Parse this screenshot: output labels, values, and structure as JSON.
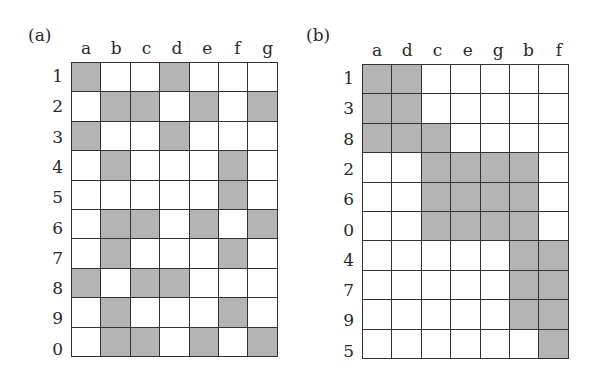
{
  "panels": [
    {
      "label": "(a)",
      "columns": [
        "a",
        "b",
        "c",
        "d",
        "e",
        "f",
        "g"
      ],
      "rows": [
        {
          "label": "1",
          "filled": [
            "a",
            "d"
          ]
        },
        {
          "label": "2",
          "filled": [
            "b",
            "c",
            "e",
            "g"
          ]
        },
        {
          "label": "3",
          "filled": [
            "a",
            "d"
          ]
        },
        {
          "label": "4",
          "filled": [
            "b",
            "f"
          ]
        },
        {
          "label": "5",
          "filled": [
            "f"
          ]
        },
        {
          "label": "6",
          "filled": [
            "b",
            "c",
            "e",
            "g"
          ]
        },
        {
          "label": "7",
          "filled": [
            "b",
            "f"
          ]
        },
        {
          "label": "8",
          "filled": [
            "a",
            "c",
            "d"
          ]
        },
        {
          "label": "9",
          "filled": [
            "b",
            "f"
          ]
        },
        {
          "label": "0",
          "filled": [
            "b",
            "c",
            "e",
            "g"
          ]
        }
      ]
    },
    {
      "label": "(b)",
      "columns": [
        "a",
        "d",
        "c",
        "e",
        "g",
        "b",
        "f"
      ],
      "rows": [
        {
          "label": "1",
          "filled": [
            "a",
            "d"
          ]
        },
        {
          "label": "3",
          "filled": [
            "a",
            "d"
          ]
        },
        {
          "label": "8",
          "filled": [
            "a",
            "d",
            "c"
          ]
        },
        {
          "label": "2",
          "filled": [
            "c",
            "e",
            "g",
            "b"
          ]
        },
        {
          "label": "6",
          "filled": [
            "c",
            "e",
            "g",
            "b"
          ]
        },
        {
          "label": "0",
          "filled": [
            "c",
            "e",
            "g",
            "b"
          ]
        },
        {
          "label": "4",
          "filled": [
            "b",
            "f"
          ]
        },
        {
          "label": "7",
          "filled": [
            "b",
            "f"
          ]
        },
        {
          "label": "9",
          "filled": [
            "b",
            "f"
          ]
        },
        {
          "label": "5",
          "filled": [
            "f"
          ]
        }
      ]
    }
  ],
  "colors": {
    "filled": "#b4b4b4",
    "empty": "#ffffff",
    "border": "#333333"
  }
}
